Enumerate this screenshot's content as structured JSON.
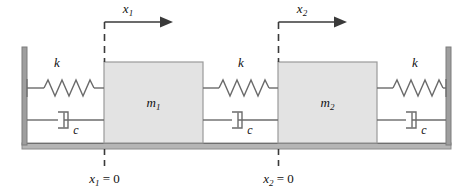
{
  "figure": {
    "kind": "mass-spring-damper-diagram",
    "background_color": "#ffffff",
    "line_color": "#6b6b6b",
    "mass_fill_color": "#e3e3e3",
    "mass_border_color": "#9a9a9a",
    "wall_color": "#8c8c8c",
    "ground_color": "#9a9a9a",
    "text_color": "#111111"
  },
  "masses": [
    {
      "id": "m1",
      "label": "m",
      "subscript": "1"
    },
    {
      "id": "m2",
      "label": "m",
      "subscript": "2"
    }
  ],
  "springs": [
    {
      "id": "k-left",
      "label": "k"
    },
    {
      "id": "k-middle",
      "label": "k"
    },
    {
      "id": "k-right",
      "label": "k"
    }
  ],
  "dampers": [
    {
      "id": "c-left",
      "label": "c"
    },
    {
      "id": "c-middle",
      "label": "c"
    },
    {
      "id": "c-right",
      "label": "c"
    }
  ],
  "coordinates": [
    {
      "id": "x1",
      "arrow_label": "x",
      "arrow_subscript": "1",
      "origin_label": "x",
      "origin_subscript": "1",
      "origin_equals": " = 0"
    },
    {
      "id": "x2",
      "arrow_label": "x",
      "arrow_subscript": "2",
      "origin_label": "x",
      "origin_subscript": "2",
      "origin_equals": " = 0"
    }
  ],
  "supports": {
    "left_wall": "fixed-wall",
    "right_wall": "fixed-wall",
    "ground": "fixed-ground"
  }
}
